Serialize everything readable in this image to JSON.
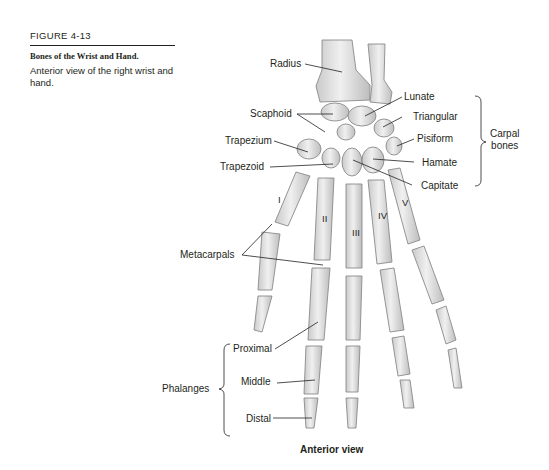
{
  "caption": {
    "figure_number": "FIGURE 4-13",
    "title": "Bones of the Wrist and Hand.",
    "description": "Anterior view of the right wrist and hand."
  },
  "labels": {
    "radius": "Radius",
    "lunate": "Lunate",
    "scaphoid": "Scaphoid",
    "triangular": "Triangular",
    "pisiform": "Pisiform",
    "trapezium": "Trapezium",
    "hamate": "Hamate",
    "trapezoid": "Trapezoid",
    "capitate": "Capitate",
    "carpal_bones_line1": "Carpal",
    "carpal_bones_line2": "bones",
    "metacarpals": "Metacarpals",
    "phalanges": "Phalanges",
    "proximal": "Proximal",
    "middle": "Middle",
    "distal": "Distal"
  },
  "digits": [
    "I",
    "II",
    "III",
    "IV",
    "V"
  ],
  "view_title": "Anterior view",
  "colors": {
    "bone_fill": "#e6e6e6",
    "bone_shade": "#bdbdbd",
    "bone_outline": "#8a8a8a",
    "text": "#231f20",
    "leader_line": "#231f20"
  }
}
